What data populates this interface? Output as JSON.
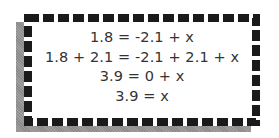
{
  "frame": {
    "border_color": "#1a1a1a",
    "shadow_color": "#8a8a8a",
    "background": "#ffffff"
  },
  "equations": [
    "1.8 = -2.1 + x",
    "1.8 + 2.1 = -2.1 + 2.1 + x",
    "3.9 = 0 + x",
    "3.9 = x"
  ]
}
